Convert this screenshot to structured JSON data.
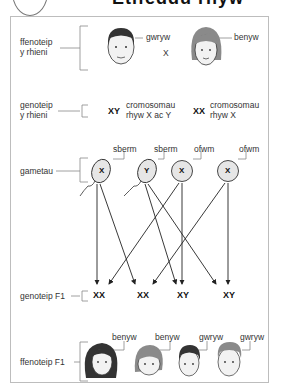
{
  "title": {
    "text": "Etifeddu rhyw"
  },
  "rows": {
    "parents_phenotype": {
      "label_line1": "ffenoteip",
      "label_line2": "y rhieni"
    },
    "parents_genotype": {
      "label_line1": "genoteip",
      "label_line2": "y rhieni"
    },
    "gametes": {
      "label": "gametau"
    },
    "f1_genotype": {
      "label": "genoteip F1"
    },
    "f1_phenotype": {
      "label": "ffenoteip F1"
    }
  },
  "parents": {
    "male": {
      "sex_label": "gwryw",
      "genotype": "XY",
      "chromosome_note_line1": "cromosomau",
      "chromosome_note_line2": "rhyw X ac Y"
    },
    "cross_symbol": "X",
    "female": {
      "sex_label": "benyw",
      "genotype": "XX",
      "chromosome_note_line1": "cromosomau",
      "chromosome_note_line2": "rhyw X"
    }
  },
  "gametes": [
    {
      "type": "sberm",
      "chromosome": "X"
    },
    {
      "type": "sberm",
      "chromosome": "Y"
    },
    {
      "type": "ofwm",
      "chromosome": "X"
    },
    {
      "type": "ofwm",
      "chromosome": "X"
    }
  ],
  "f1": [
    {
      "genotype": "XX",
      "sex_label": "benyw"
    },
    {
      "genotype": "XX",
      "sex_label": "benyw"
    },
    {
      "genotype": "XY",
      "sex_label": "gwryw"
    },
    {
      "genotype": "XY",
      "sex_label": "gwryw"
    }
  ],
  "colors": {
    "line": "#222222",
    "gamete_fill": "#e6e6e6",
    "hair_dark": "#333333",
    "hair_mid": "#8a8a8a",
    "skin": "#f2f2f2"
  }
}
